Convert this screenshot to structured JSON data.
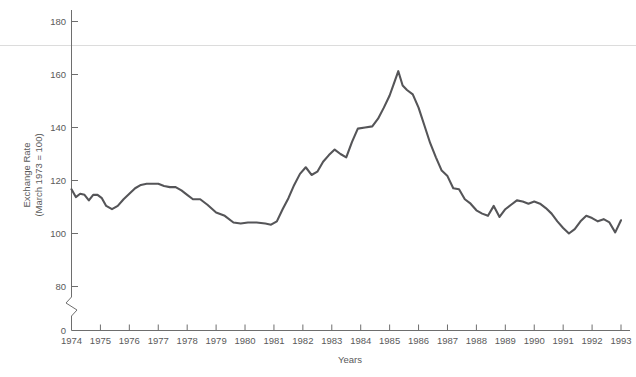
{
  "chart_data": {
    "type": "line",
    "title": "",
    "xlabel": "Years",
    "ylabel": "Exchange Rate\n(March 1973 = 100)",
    "ylabel_line1": "Exchange Rate",
    "ylabel_line2": "(March 1973 = 100)",
    "xlim": [
      1974,
      1993
    ],
    "ylim": [
      60,
      188
    ],
    "yticks": [
      0,
      60,
      80,
      100,
      120,
      140,
      160,
      180
    ],
    "ytick_labels": [
      "0",
      "60",
      "80",
      "100",
      "120",
      "140",
      "160",
      "180"
    ],
    "axis_break": true,
    "axis_break_note": "zigzag break between 0 and 60",
    "grid": false,
    "legend": null,
    "line_color": "#555558",
    "axis_color": "#6e6e6e",
    "xticks": [
      1974,
      1975,
      1976,
      1977,
      1978,
      1979,
      1980,
      1981,
      1982,
      1983,
      1984,
      1985,
      1986,
      1987,
      1988,
      1989,
      1990,
      1991,
      1992,
      1993
    ],
    "xtick_labels": [
      "1974",
      "1975",
      "1976",
      "1977",
      "1978",
      "1979",
      "1980",
      "1981",
      "1982",
      "1983",
      "1984",
      "1985",
      "1986",
      "1987",
      "1988",
      "1989",
      "1990",
      "1991",
      "1992",
      "1993"
    ],
    "series": [
      {
        "name": "Exchange Rate",
        "x": [
          1974.0,
          1974.15,
          1974.3,
          1974.45,
          1974.6,
          1974.75,
          1974.9,
          1975.05,
          1975.2,
          1975.4,
          1975.6,
          1975.8,
          1976.0,
          1976.2,
          1976.4,
          1976.6,
          1976.8,
          1977.0,
          1977.2,
          1977.4,
          1977.6,
          1977.8,
          1978.0,
          1978.2,
          1978.45,
          1978.7,
          1979.0,
          1979.3,
          1979.6,
          1979.85,
          1980.1,
          1980.4,
          1980.7,
          1980.9,
          1981.1,
          1981.3,
          1981.5,
          1981.7,
          1981.9,
          1982.1,
          1982.3,
          1982.5,
          1982.7,
          1982.9,
          1983.1,
          1983.3,
          1983.5,
          1983.7,
          1983.9,
          1984.15,
          1984.4,
          1984.6,
          1984.8,
          1985.0,
          1985.15,
          1985.3,
          1985.45,
          1985.6,
          1985.8,
          1986.0,
          1986.2,
          1986.4,
          1986.6,
          1986.8,
          1987.0,
          1987.2,
          1987.4,
          1987.6,
          1987.8,
          1988.0,
          1988.2,
          1988.4,
          1988.6,
          1988.8,
          1989.0,
          1989.2,
          1989.4,
          1989.6,
          1989.8,
          1990.0,
          1990.2,
          1990.4,
          1990.6,
          1990.8,
          1991.0,
          1991.2,
          1991.4,
          1991.6,
          1991.8,
          1992.0,
          1992.2,
          1992.4,
          1992.6,
          1992.8,
          1993.0
        ],
        "values": [
          104.0,
          100.5,
          102.0,
          101.5,
          99.0,
          101.5,
          101.5,
          100.0,
          96.5,
          95.0,
          96.5,
          99.5,
          102.0,
          104.5,
          106.0,
          106.5,
          106.5,
          106.5,
          105.5,
          105.0,
          105.0,
          103.5,
          101.5,
          99.5,
          99.5,
          97.0,
          93.5,
          92.0,
          89.0,
          88.5,
          89.0,
          89.0,
          88.5,
          88.0,
          89.5,
          95.0,
          100.0,
          106.0,
          111.0,
          114.0,
          110.5,
          112.0,
          116.5,
          119.5,
          122.0,
          120.0,
          118.5,
          125.5,
          131.5,
          132.0,
          132.5,
          136.0,
          141.0,
          146.5,
          152.0,
          157.5,
          151.0,
          149.0,
          147.0,
          141.0,
          133.0,
          125.0,
          118.5,
          112.5,
          110.0,
          104.5,
          104.0,
          99.5,
          97.5,
          94.5,
          93.0,
          92.0,
          96.5,
          91.5,
          95.0,
          97.0,
          99.0,
          98.5,
          97.5,
          98.5,
          97.5,
          95.5,
          93.0,
          89.5,
          86.5,
          84.0,
          86.0,
          89.5,
          92.0,
          91.0,
          89.5,
          90.5,
          89.0,
          84.5,
          90.0
        ]
      }
    ]
  },
  "figure": {
    "background": "#ffffff",
    "axis_title_x": "Years"
  }
}
